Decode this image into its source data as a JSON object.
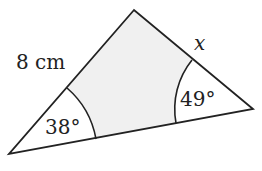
{
  "diagram": {
    "type": "triangle",
    "vertices": {
      "top": [
        134,
        10
      ],
      "left": [
        9,
        154
      ],
      "right": [
        253,
        109
      ]
    },
    "fill_color": "#f0f0f0",
    "stroke_color": "#222222",
    "labels": {
      "side_left": "8 cm",
      "side_right_variable": "x",
      "angle_left": "38°",
      "angle_right": "49°"
    }
  }
}
